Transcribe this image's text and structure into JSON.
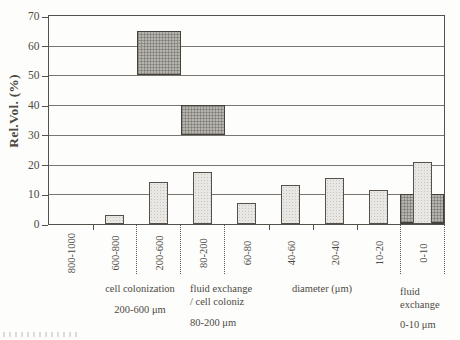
{
  "chart_data": {
    "type": "bar",
    "title": "",
    "ylabel": "Rel.Vol. (%)",
    "ylim": [
      0,
      70
    ],
    "ytick_step": 10,
    "grid": "horizontal solid lines every 10",
    "legend": "none",
    "categories": [
      "800-1000",
      "600-800",
      "200-600",
      "80-200",
      "60-80",
      "40-60",
      "20-40",
      "10-20",
      "0-10"
    ],
    "series": [
      {
        "name": "relative volume per pore-diameter class",
        "style": "light-stippled-bar",
        "values": [
          0,
          3,
          14,
          17.5,
          7,
          13,
          15.5,
          11.5,
          21
        ]
      },
      {
        "name": "highlighted functional pore-size ranges",
        "style": "dark-crosshatch-range-bar",
        "ranges": [
          {
            "category": "200-600",
            "from": 50,
            "to": 65
          },
          {
            "category": "80-200",
            "from": 30,
            "to": 40
          },
          {
            "category": "0-10",
            "from": 0,
            "to": 10
          }
        ]
      }
    ],
    "annotations": {
      "cell_colonization": {
        "line1": "cell colonization",
        "line2": "200-600 μm"
      },
      "fluid_cell": {
        "line1": "fluid exchange",
        "line2": "/ cell coloniz",
        "line3": "80-200 μm"
      },
      "diameter_label": "diameter (μm)",
      "fluid_exchange": {
        "line1": "fluid",
        "line2": "exchange",
        "line3": "0-10 μm"
      }
    },
    "colors": {
      "light_bar": "#e8e7e3",
      "dark_bar": "#b6b4af",
      "axis_text": "#4e4a43",
      "gridline": "#7a766f",
      "background": "#fdfdfb"
    }
  }
}
